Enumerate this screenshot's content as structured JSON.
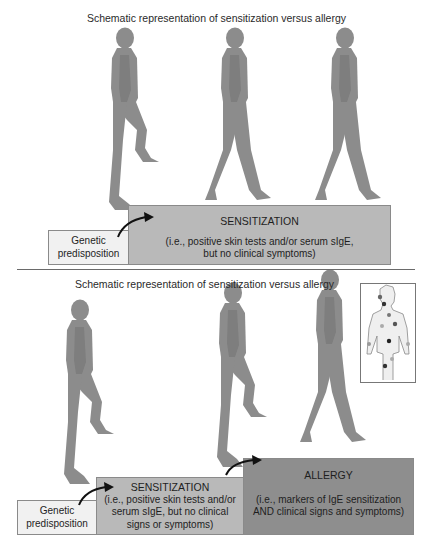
{
  "panels": [
    {
      "title": "Schematic representation of sensitization versus allergy",
      "steps": [
        {
          "label": "Genetic predisposition",
          "lines": [
            "Genetic",
            "predisposition"
          ]
        },
        {
          "heading": "SENSITIZATION",
          "lines": [
            "(i.e., positive skin tests and/or serum sIgE,",
            "but no clinical symptoms)"
          ]
        }
      ],
      "figures": 3
    },
    {
      "title": "Schematic representation of sensitization versus allergy",
      "steps": [
        {
          "label": "Genetic predisposition",
          "lines": [
            "Genetic",
            "predisposition"
          ]
        },
        {
          "heading": "SENSITIZATION",
          "lines": [
            "(i.e., positive skin tests and/or",
            "serum sIgE, but no clinical",
            "signs or symptoms)"
          ]
        },
        {
          "heading": "ALLERGY",
          "lines": [
            "(i.e., markers of IgE sensitization",
            "AND clinical signs and symptoms)"
          ]
        }
      ],
      "figures": 3,
      "inset": "body-with-allergy-sites"
    }
  ],
  "colors": {
    "figure": "#8c8c8c",
    "genetic_box": "#f1f1f1",
    "sensitization_box": "#b9b9b9",
    "allergy_box": "#8e8e8e",
    "arrow": "#111111"
  }
}
